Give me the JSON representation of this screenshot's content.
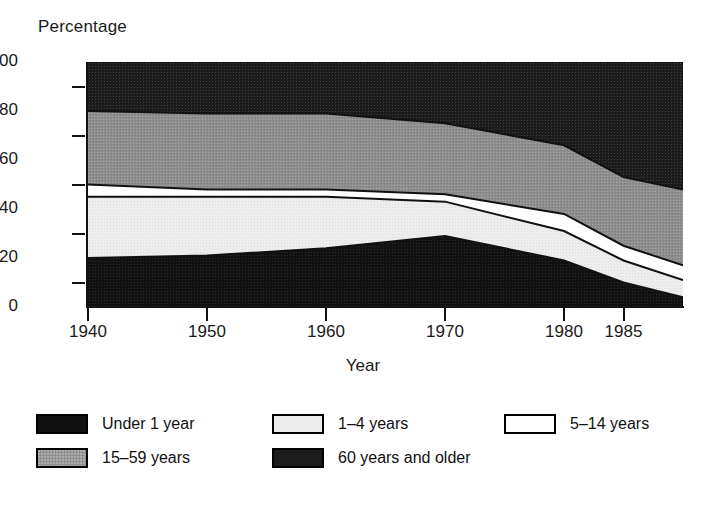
{
  "chart_data": {
    "type": "area",
    "title": "",
    "ylabel": "Percentage",
    "xlabel": "Year",
    "ylim": [
      0,
      100
    ],
    "xlim": [
      1940,
      1990
    ],
    "grid": false,
    "legend_position": "bottom",
    "stacked": true,
    "x": [
      1940,
      1950,
      1960,
      1970,
      1980,
      1985,
      1990
    ],
    "y_ticks": [
      "0",
      "20",
      "40",
      "60",
      "80",
      "100"
    ],
    "x_ticks": [
      "1940",
      "1950",
      "1960",
      "1970",
      "1980",
      "1985"
    ],
    "series": [
      {
        "name": "Under 1 year",
        "swatch": "black",
        "values": [
          20,
          21,
          24,
          29,
          19,
          10,
          4
        ]
      },
      {
        "name": "1–4 years",
        "swatch": "light",
        "values": [
          25,
          24,
          21,
          14,
          12,
          9,
          7
        ]
      },
      {
        "name": "5–14 years",
        "swatch": "white",
        "values": [
          5,
          3,
          3,
          3,
          7,
          6,
          6
        ]
      },
      {
        "name": "15–59 years",
        "swatch": "gray",
        "values": [
          30,
          31,
          31,
          29,
          28,
          28,
          31
        ]
      },
      {
        "name": "60 years and older",
        "swatch": "verydark",
        "values": [
          20,
          21,
          21,
          25,
          34,
          47,
          52
        ]
      }
    ],
    "cumulative_upper_bounds": {
      "under_1_year": [
        20,
        21,
        24,
        29,
        19,
        10,
        4
      ],
      "1_4_years": [
        45,
        45,
        45,
        43,
        31,
        19,
        11
      ],
      "5_14_years": [
        50,
        48,
        48,
        46,
        38,
        25,
        17
      ],
      "15_59_years": [
        80,
        79,
        79,
        75,
        66,
        53,
        48
      ],
      "60_years_and_older": [
        100,
        100,
        100,
        100,
        100,
        100,
        100
      ]
    }
  },
  "axis": {
    "y_title": "Percentage",
    "x_title": "Year",
    "y_ticks": [
      {
        "label": "100",
        "value": 100
      },
      {
        "label": "80",
        "value": 80
      },
      {
        "label": "60",
        "value": 60
      },
      {
        "label": "40",
        "value": 40
      },
      {
        "label": "20",
        "value": 20
      },
      {
        "label": "0",
        "value": 0
      }
    ],
    "y_minor_ticks": [
      90,
      70,
      50,
      30,
      10
    ],
    "x_ticks": [
      {
        "label": "1940",
        "value": 1940
      },
      {
        "label": "1950",
        "value": 1950
      },
      {
        "label": "1960",
        "value": 1960
      },
      {
        "label": "1970",
        "value": 1970
      },
      {
        "label": "1980",
        "value": 1980
      },
      {
        "label": "1985",
        "value": 1985
      }
    ]
  },
  "legend": {
    "rows": [
      [
        {
          "label": "Under 1 year",
          "swatch": "black"
        },
        {
          "label": "1–4 years",
          "swatch": "light"
        },
        {
          "label": "5–14 years",
          "swatch": "white"
        }
      ],
      [
        {
          "label": "15–59 years",
          "swatch": "gray"
        },
        {
          "label": "60 years and older",
          "swatch": "verydark"
        }
      ]
    ]
  },
  "colors": {
    "black": "#111111",
    "verydark": "#1c1c1c",
    "gray": "#8e8e8e",
    "light": "#ececec",
    "white": "#ffffff",
    "axis": "#111111",
    "text": "#1a1a1a",
    "background": "#ffffff"
  }
}
